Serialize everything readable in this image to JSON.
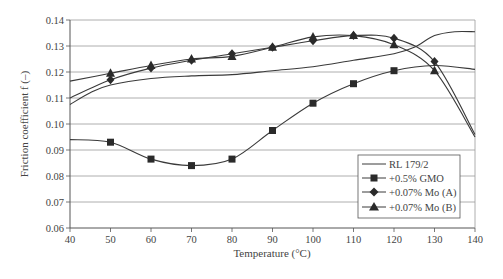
{
  "chart_data": {
    "type": "line",
    "title": "",
    "xlabel": "Temperature (°C)",
    "ylabel": "Friction coefficient f (–)",
    "xlim": [
      40,
      140
    ],
    "ylim": [
      0.06,
      0.14
    ],
    "x_ticks": [
      "40",
      "50",
      "60",
      "70",
      "80",
      "90",
      "100",
      "110",
      "120",
      "130",
      "140"
    ],
    "y_ticks": [
      "0.06",
      "0.07",
      "0.08",
      "0.09",
      "0.10",
      "0.11",
      "0.12",
      "0.13",
      "0.14"
    ],
    "grid": "horizontal",
    "legend_position": "lower right",
    "series": [
      {
        "name": "RL 179/2",
        "marker": "none",
        "x": [
          40,
          45,
          50,
          60,
          70,
          80,
          90,
          100,
          110,
          120,
          125,
          130,
          135,
          140
        ],
        "values": [
          0.1075,
          0.112,
          0.115,
          0.1175,
          0.1185,
          0.119,
          0.1205,
          0.122,
          0.1245,
          0.127,
          0.1295,
          0.134,
          0.1355,
          0.1355
        ]
      },
      {
        "name": "+0.5% GMO",
        "marker": "square",
        "x": [
          40,
          50,
          60,
          70,
          80,
          90,
          100,
          110,
          120,
          130,
          140
        ],
        "values": [
          0.094,
          0.093,
          0.0865,
          0.084,
          0.0865,
          0.0975,
          0.108,
          0.1155,
          0.1205,
          0.1225,
          0.121
        ],
        "marker_x": [
          50,
          60,
          70,
          80,
          90,
          100,
          110,
          120
        ]
      },
      {
        "name": "+0.07% Mo (A)",
        "marker": "diamond",
        "x": [
          40,
          50,
          60,
          70,
          80,
          90,
          100,
          110,
          120,
          130,
          140
        ],
        "values": [
          0.11,
          0.117,
          0.1215,
          0.1245,
          0.127,
          0.1295,
          0.132,
          0.134,
          0.133,
          0.124,
          0.096
        ],
        "marker_x": [
          50,
          60,
          70,
          80,
          90,
          100,
          110,
          120,
          130
        ]
      },
      {
        "name": "+0.07% Mo (B)",
        "marker": "triangle",
        "x": [
          40,
          50,
          60,
          70,
          80,
          90,
          100,
          110,
          120,
          130,
          140
        ],
        "values": [
          0.1165,
          0.1195,
          0.1225,
          0.125,
          0.126,
          0.1295,
          0.1335,
          0.134,
          0.1305,
          0.1205,
          0.095
        ],
        "marker_x": [
          50,
          60,
          70,
          80,
          90,
          100,
          110,
          120,
          130
        ]
      }
    ]
  },
  "axes": {
    "x_title": "Temperature (°C)",
    "y_title": "Friction coefficient  f (–)"
  },
  "legend": {
    "items": [
      {
        "label": "RL 179/2",
        "icon": "plain-line"
      },
      {
        "label": "+0.5% GMO",
        "icon": "square-marker"
      },
      {
        "label": "+0.07% Mo (A)",
        "icon": "diamond-marker"
      },
      {
        "label": "+0.07% Mo (B)",
        "icon": "triangle-marker"
      }
    ]
  },
  "colors": {
    "line": "#3a3a3a",
    "grid": "#9a9a9a",
    "axis": "#555555",
    "text": "#444444"
  }
}
